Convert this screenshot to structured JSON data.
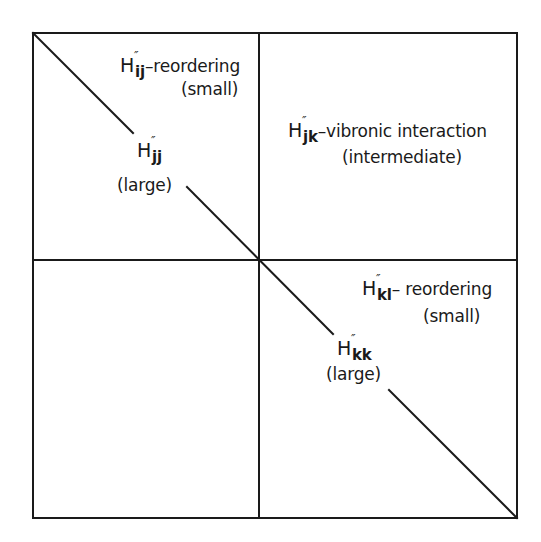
{
  "diagram": {
    "type": "block matrix schematic",
    "frame": {
      "stroke_color": "#1a1a1a",
      "background": "#ffffff"
    },
    "blocks": {
      "upper_left": {
        "diag_symbol": {
          "letter": "H",
          "primes": "″",
          "subscript": "jj"
        },
        "diag_size": "(large)",
        "offdiag_symbol": {
          "letter": "H",
          "primes": "″",
          "subscript": "ij"
        },
        "offdiag_desc": "–reordering",
        "offdiag_size": "(small)"
      },
      "upper_right": {
        "symbol": {
          "letter": "H",
          "primes": "″",
          "subscript": "jk"
        },
        "desc": "–vibronic interaction",
        "size": "(intermediate)"
      },
      "lower_right": {
        "diag_symbol": {
          "letter": "H",
          "primes": "″",
          "subscript": "kk"
        },
        "diag_size": "(large)",
        "offdiag_symbol": {
          "letter": "H",
          "primes": "″",
          "subscript": "kl"
        },
        "offdiag_desc": "– reordering",
        "offdiag_size": "(small)"
      },
      "lower_left": {}
    }
  }
}
